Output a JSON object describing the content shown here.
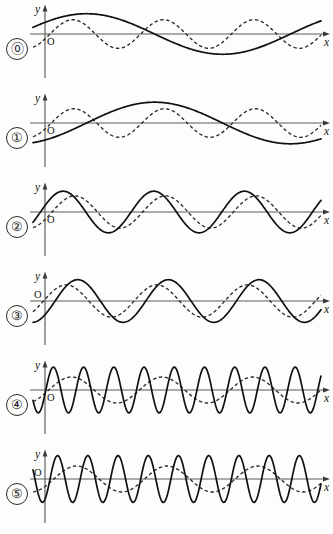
{
  "figure": {
    "background_color": "#fdfdfc",
    "ink_color": "#101010",
    "axis_color": "#5b5b5b",
    "width": 333,
    "height": 534,
    "row_count": 6,
    "axis": {
      "y_label": "y",
      "x_label": "x",
      "origin_label": "O"
    }
  },
  "chart_data": {
    "type": "line",
    "xlabel": "x",
    "ylabel": "y",
    "grid": false,
    "legend": null,
    "axis_x_range": [
      0,
      6.2832
    ],
    "axis_y_range": [
      -1.25,
      1.25
    ],
    "row_labels": [
      "⓪",
      "①",
      "②",
      "③",
      "④",
      "⑤"
    ],
    "rows": [
      {
        "index": 0,
        "label": "⓪",
        "series": [
          {
            "name": "solid",
            "style": "solid",
            "amplitude": 0.78,
            "cycles": 1,
            "phase_deg": 35,
            "description": "slow wave, starts above axis rising to a broad crest then a broad trough"
          },
          {
            "name": "dashed",
            "style": "dashed",
            "amplitude": 0.55,
            "cycles": 3,
            "phase_deg": -20,
            "description": "faster wave, three crests across the width"
          }
        ]
      },
      {
        "index": 1,
        "label": "①",
        "series": [
          {
            "name": "solid",
            "style": "solid",
            "amplitude": 0.8,
            "cycles": 1,
            "phase_deg": -55,
            "description": "slow wave, starts below the axis, rises to one crest, falls again"
          },
          {
            "name": "dashed",
            "style": "dashed",
            "amplitude": 0.55,
            "cycles": 3,
            "phase_deg": -25,
            "description": "three crests across the width"
          }
        ]
      },
      {
        "index": 2,
        "label": "②",
        "series": [
          {
            "name": "solid",
            "style": "solid",
            "amplitude": 0.8,
            "cycles": 3,
            "phase_deg": 18,
            "description": "three full cycles, crest first"
          },
          {
            "name": "dashed",
            "style": "dashed",
            "amplitude": 0.62,
            "cycles": 3,
            "phase_deg": -28,
            "description": "three full cycles, lagging the solid curve"
          }
        ]
      },
      {
        "index": 3,
        "label": "③",
        "series": [
          {
            "name": "solid",
            "style": "solid",
            "amplitude": 0.82,
            "cycles": 3,
            "phase_deg": -40,
            "description": "three full cycles, starts near zero going down then up"
          },
          {
            "name": "dashed",
            "style": "dashed",
            "amplitude": 0.62,
            "cycles": 3,
            "phase_deg": 6,
            "description": "three full cycles, leading the solid curve"
          }
        ]
      },
      {
        "index": 4,
        "label": "④",
        "series": [
          {
            "name": "solid",
            "style": "solid",
            "amplitude": 0.88,
            "cycles": 9,
            "phase_deg": -10,
            "description": "nine rapid cycles of large amplitude"
          },
          {
            "name": "dashed",
            "style": "dashed",
            "amplitude": 0.5,
            "cycles": 3,
            "phase_deg": -15,
            "description": "slow three-cycle envelope-like wave"
          }
        ]
      },
      {
        "index": 5,
        "label": "⑤",
        "series": [
          {
            "name": "solid",
            "style": "solid",
            "amplitude": 0.9,
            "cycles": 9,
            "phase_deg": -60,
            "description": "nine rapid cycles, shifted relative to row 4"
          },
          {
            "name": "dashed",
            "style": "dashed",
            "amplitude": 0.5,
            "cycles": 3,
            "phase_deg": -35,
            "description": "slow three-cycle wave, shifted"
          }
        ]
      }
    ]
  }
}
